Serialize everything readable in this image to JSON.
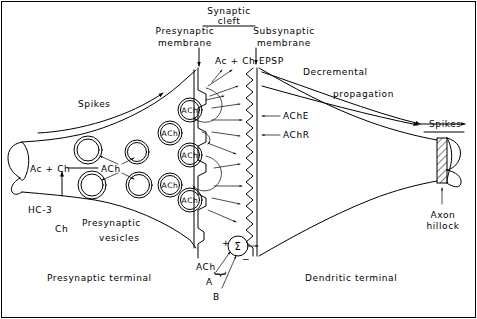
{
  "figure": {
    "background_color": "#ffffff",
    "ink_color": "#000000",
    "width": 477,
    "height": 319
  },
  "labels": {
    "synaptic_cleft_line1": "Synaptic",
    "synaptic_cleft_line2": "cleft",
    "presynaptic_membrane_line1": "Presynaptic",
    "presynaptic_membrane_line2": "membrane",
    "subsynaptic_membrane_line1": "Subsynaptic",
    "subsynaptic_membrane_line2": "membrane",
    "epsp": "EPSP",
    "ac_plus_ch_cleft": "Ac + Ch",
    "decremental_line1": "Decremental",
    "decremental_line2": "propagation",
    "spikes_left": "Spikes",
    "spikes_right": "Spikes",
    "ache": "AChE",
    "achr": "AChR",
    "ac_plus_ch_terminal": "Ac + Ch",
    "ach_synthesis": "ACh",
    "hc3": "HC-3",
    "ch": "Ch",
    "presynaptic_vesicles_line1": "Presynaptic",
    "presynaptic_vesicles_line2": "vesicles",
    "presynaptic_terminal": "Presynaptic terminal",
    "dendritic_terminal": "Dendritic terminal",
    "axon_hillock_line1": "Axon",
    "axon_hillock_line2": "hillock",
    "summation_symbol": "Σ",
    "plus_sign": "+",
    "minus_sign": "−",
    "input_ach": "ACh",
    "input_a": "A",
    "input_b": "B",
    "brace": "}"
  },
  "vesicles": {
    "empty_label": "",
    "filled_label": "ACh",
    "empty_positions": [
      {
        "cx": 88,
        "cy": 150,
        "r": 14
      },
      {
        "cx": 137,
        "cy": 152,
        "r": 12
      },
      {
        "cx": 92,
        "cy": 185,
        "r": 14
      },
      {
        "cx": 139,
        "cy": 185,
        "r": 13
      }
    ],
    "filled_positions": [
      {
        "cx": 170,
        "cy": 133,
        "r": 12
      },
      {
        "cx": 170,
        "cy": 185,
        "r": 12
      },
      {
        "cx": 190,
        "cy": 110,
        "r": 12
      },
      {
        "cx": 190,
        "cy": 155,
        "r": 12
      },
      {
        "cx": 190,
        "cy": 200,
        "r": 12
      }
    ]
  }
}
